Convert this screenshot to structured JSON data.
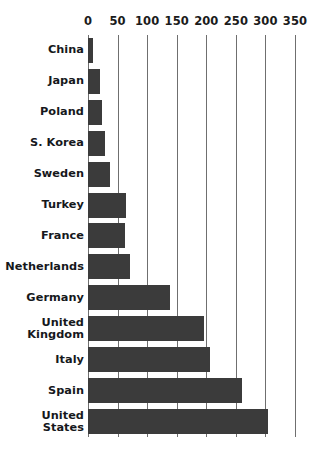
{
  "chart_data": {
    "type": "bar",
    "orientation": "horizontal",
    "title": "",
    "subtitle": "",
    "xlabel": "",
    "ylabel": "",
    "xlim": [
      0,
      350
    ],
    "grid": true,
    "legend": false,
    "bar_color": "#3b3b3b",
    "gridline_color": "#6f6f6f",
    "background_color": "#ffffff",
    "x_ticks": [
      0,
      50,
      100,
      150,
      200,
      250,
      300,
      350
    ],
    "x_tick_labels": [
      "0",
      "50",
      "100",
      "150",
      "200",
      "250",
      "300",
      "350"
    ],
    "categories": [
      "China",
      "Japan",
      "Poland",
      "S. Korea",
      "Sweden",
      "Turkey",
      "France",
      "Netherlands",
      "Germany",
      "United Kingdom",
      "Italy",
      "Spain",
      "United States"
    ],
    "values": [
      8,
      21,
      23,
      28,
      38,
      64,
      63,
      71,
      138,
      196,
      207,
      260,
      305
    ]
  }
}
